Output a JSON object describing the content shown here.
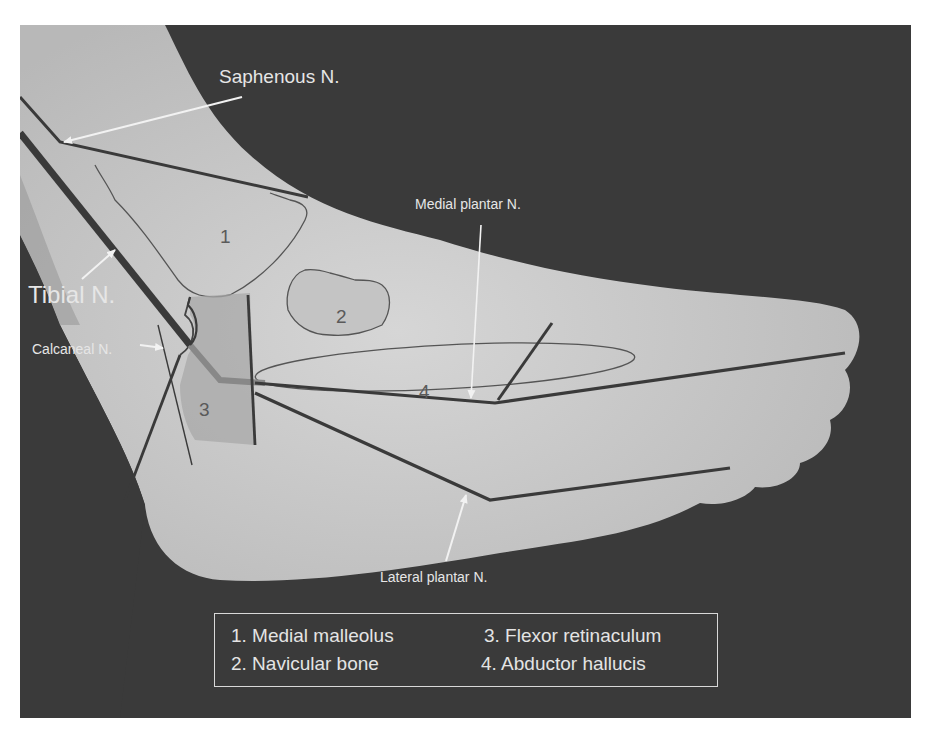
{
  "figure": {
    "colors": {
      "background": "#3a3a3a",
      "skin": "#c8c8c8",
      "nerve_line": "#3c3c3c",
      "label_text": "#e6e6e6",
      "outline": "#555555"
    }
  },
  "nerve_labels": {
    "saphenous": "Saphenous N.",
    "tibial": "Tibial N.",
    "calcaneal": "Calcaneal N.",
    "medial_plantar": "Medial plantar N.",
    "lateral_plantar": "Lateral plantar N."
  },
  "regions": {
    "r1": "1",
    "r2": "2",
    "r3": "3",
    "r4": "4"
  },
  "legend": {
    "items": [
      {
        "num": "1.",
        "label": "Medial malleolus",
        "text": "1. Medial malleolus"
      },
      {
        "num": "2.",
        "label": "Navicular bone",
        "text": "2. Navicular bone"
      },
      {
        "num": "3.",
        "label": "Flexor retinaculum",
        "text": "3. Flexor retinaculum"
      },
      {
        "num": "4.",
        "label": "Abductor hallucis",
        "text": "4. Abductor hallucis"
      }
    ]
  }
}
